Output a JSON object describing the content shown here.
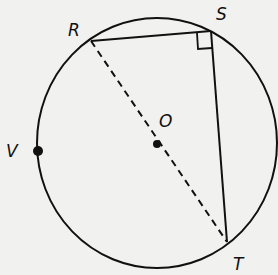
{
  "diagram": {
    "type": "circle-geometry",
    "circle": {
      "center_label": "O",
      "cx": 157,
      "cy": 143,
      "rx": 120,
      "ry": 125
    },
    "points": {
      "R": {
        "label": "R",
        "x": 91,
        "y": 41
      },
      "S": {
        "label": "S",
        "x": 211,
        "y": 31
      },
      "T": {
        "label": "T",
        "x": 227,
        "y": 242
      },
      "O": {
        "label": "O",
        "x": 157,
        "y": 144
      },
      "V": {
        "label": "V",
        "x": 38,
        "y": 151
      }
    },
    "segments": [
      {
        "from": "R",
        "to": "S",
        "style": "solid"
      },
      {
        "from": "S",
        "to": "T",
        "style": "solid"
      },
      {
        "from": "R",
        "to": "T",
        "style": "dashed",
        "through": "O"
      }
    ],
    "right_angle_at": "S",
    "colors": {
      "stroke": "#111111",
      "background": "#f1f1ef"
    }
  }
}
